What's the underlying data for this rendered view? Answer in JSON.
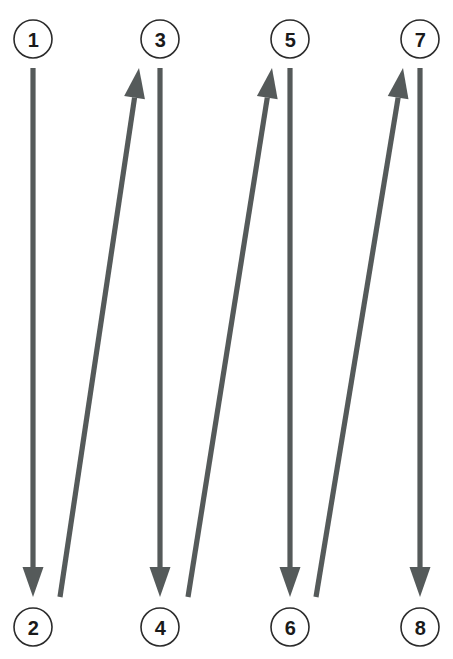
{
  "diagram": {
    "type": "serpentine-path",
    "title": "",
    "canvas": {
      "width": 453,
      "height": 659,
      "background": "#ffffff"
    },
    "style": {
      "edge_color": "#555a5a",
      "node_stroke_color": "#2b2b2b",
      "node_fill_color": "#ffffff",
      "label_color": "#1a1a1a",
      "edge_stroke_width": 5.2,
      "node_radius": 19
    },
    "nodes": [
      {
        "id": "node-1",
        "label": "1",
        "cx": 33,
        "cy": 39,
        "row": "top"
      },
      {
        "id": "node-2",
        "label": "2",
        "cx": 33,
        "cy": 627,
        "row": "bottom"
      },
      {
        "id": "node-3",
        "label": "3",
        "cx": 160,
        "cy": 39,
        "row": "top"
      },
      {
        "id": "node-4",
        "label": "4",
        "cx": 160,
        "cy": 627,
        "row": "bottom"
      },
      {
        "id": "node-5",
        "label": "5",
        "cx": 290,
        "cy": 39,
        "row": "top"
      },
      {
        "id": "node-6",
        "label": "6",
        "cx": 290,
        "cy": 627,
        "row": "bottom"
      },
      {
        "id": "node-7",
        "label": "7",
        "cx": 420,
        "cy": 39,
        "row": "top"
      },
      {
        "id": "node-8",
        "label": "8",
        "cx": 420,
        "cy": 627,
        "row": "bottom"
      }
    ],
    "edges": [
      {
        "id": "edge-1-2",
        "from": "1",
        "to": "2",
        "direction": "down",
        "orientation": "vertical",
        "x1": 33,
        "y1": 68,
        "x2": 33,
        "y2": 597
      },
      {
        "id": "edge-2-3",
        "from": "2",
        "to": "3",
        "direction": "up",
        "orientation": "diagonal",
        "x1": 60,
        "y1": 597,
        "x2": 139,
        "y2": 68
      },
      {
        "id": "edge-3-4",
        "from": "3",
        "to": "4",
        "direction": "down",
        "orientation": "vertical",
        "x1": 160,
        "y1": 68,
        "x2": 160,
        "y2": 597
      },
      {
        "id": "edge-4-5",
        "from": "4",
        "to": "5",
        "direction": "up",
        "orientation": "diagonal",
        "x1": 188,
        "y1": 597,
        "x2": 272,
        "y2": 68
      },
      {
        "id": "edge-5-6",
        "from": "5",
        "to": "6",
        "direction": "down",
        "orientation": "vertical",
        "x1": 290,
        "y1": 68,
        "x2": 290,
        "y2": 597
      },
      {
        "id": "edge-6-7",
        "from": "6",
        "to": "7",
        "direction": "up",
        "orientation": "diagonal",
        "x1": 316,
        "y1": 597,
        "x2": 403,
        "y2": 68
      },
      {
        "id": "edge-7-8",
        "from": "7",
        "to": "8",
        "direction": "down",
        "orientation": "vertical",
        "x1": 420,
        "y1": 68,
        "x2": 420,
        "y2": 597
      }
    ],
    "sequence": [
      "1",
      "2",
      "3",
      "4",
      "5",
      "6",
      "7",
      "8"
    ]
  }
}
